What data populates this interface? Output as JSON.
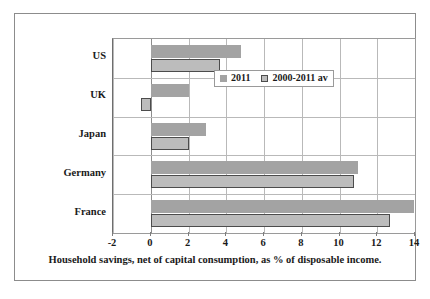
{
  "chart_data": {
    "type": "bar",
    "orientation": "horizontal",
    "title": "",
    "xlabel": "Household savings, net of capital consumption, as % of disposable income.",
    "ylabel": "",
    "xlim": [
      -2,
      14
    ],
    "xticks": [
      -2,
      0,
      2,
      4,
      6,
      8,
      10,
      12,
      14
    ],
    "xtick_labels": [
      "-2",
      "0",
      "2",
      "4",
      "6",
      "8",
      "10",
      "12",
      "14"
    ],
    "categories": [
      "US",
      "UK",
      "Japan",
      "Germany",
      "France"
    ],
    "grid": true,
    "legend_position": "inside-upper-right",
    "series": [
      {
        "name": "2011",
        "color": "#a3a3a3",
        "values": [
          4.8,
          2.05,
          2.95,
          11.0,
          13.95
        ]
      },
      {
        "name": "2000-2011 av",
        "color": "#bcbcbc",
        "values": [
          3.65,
          -0.5,
          2.05,
          10.75,
          12.7
        ]
      }
    ]
  },
  "legend": {
    "items": [
      {
        "label": "2011",
        "swatch": "series-2011-swatch"
      },
      {
        "label": "2000-2011 av",
        "swatch": "series-average-swatch"
      }
    ]
  },
  "axis": {
    "x_title": "Household savings, net of capital consumption, as % of disposable income."
  }
}
